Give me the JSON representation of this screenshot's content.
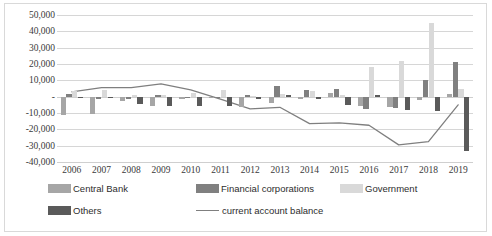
{
  "chart_data": {
    "type": "bar",
    "title": "",
    "subtitle": "",
    "xlabel": "",
    "ylabel": "",
    "categories": [
      "2006",
      "2007",
      "2008",
      "2009",
      "2010",
      "2011",
      "2012",
      "2013",
      "2014",
      "2015",
      "2016",
      "2017",
      "2018",
      "2019"
    ],
    "ylim": [
      -40000,
      50000
    ],
    "ytick_values": [
      50000,
      40000,
      30000,
      20000,
      10000,
      0,
      -10000,
      -20000,
      -30000,
      -40000
    ],
    "ytick_labels": [
      "50,000",
      "40,000",
      "30,000",
      "20,000",
      "10,000",
      "-",
      "-10,000",
      "-20,000",
      "-30,000",
      "-40,000"
    ],
    "grid": true,
    "legend_position": "bottom",
    "series": [
      {
        "name": "Central Bank",
        "type": "bar",
        "color": "#a6a6a6",
        "values": [
          -11500,
          -10500,
          -2800,
          -5500,
          -1200,
          -1000,
          -6200,
          -4000,
          -1500,
          2000,
          -6000,
          -6200,
          -1800,
          1500
        ]
      },
      {
        "name": "Financial corporations",
        "type": "bar",
        "color": "#808080",
        "values": [
          1800,
          -1500,
          -1300,
          1200,
          -1000,
          -1100,
          1000,
          6500,
          3800,
          5000,
          -7800,
          -7000,
          10500,
          21500
        ]
      },
      {
        "name": "Government",
        "type": "bar",
        "color": "#d9d9d9",
        "values": [
          3500,
          4200,
          1200,
          1000,
          2200,
          4200,
          500,
          1500,
          3300,
          1200,
          18000,
          22000,
          45000,
          4500
        ]
      },
      {
        "name": "Others",
        "type": "bar",
        "color": "#5a5a5a",
        "values": [
          -1000,
          -900,
          -4200,
          -6000,
          -5500,
          -5500,
          -1200,
          900,
          -1300,
          -5200,
          1000,
          -8000,
          -8500,
          -33000
        ]
      },
      {
        "name": "current account balance",
        "type": "line",
        "color": "#7f7f7f",
        "values": [
          3000,
          5500,
          5500,
          7800,
          4200,
          -1500,
          -7500,
          -6500,
          -16500,
          -16000,
          -17500,
          -29500,
          -27500,
          -5000
        ]
      }
    ]
  },
  "legend": {
    "rows": [
      [
        {
          "label": "Central Bank",
          "kind": "swatch",
          "color": "#a6a6a6"
        },
        {
          "label": "Financial corporations",
          "kind": "swatch",
          "color": "#808080"
        },
        {
          "label": "Government",
          "kind": "swatch",
          "color": "#d9d9d9"
        }
      ],
      [
        {
          "label": "Others",
          "kind": "swatch",
          "color": "#5a5a5a"
        },
        {
          "label": "current account balance",
          "kind": "line",
          "color": "#7f7f7f"
        }
      ]
    ]
  }
}
